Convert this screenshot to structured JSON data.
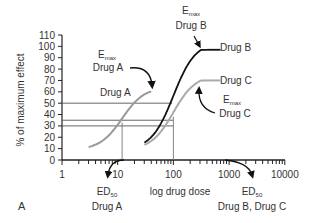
{
  "chart_data": {
    "type": "line",
    "title": "",
    "panel_label": "A",
    "xlabel": "log drug dose",
    "ylabel": "% of maximum effect",
    "x_scale": "log",
    "x_ticks": [
      "1",
      "10",
      "100",
      "1000",
      "10000"
    ],
    "y_ticks": [
      "0",
      "10",
      "20",
      "30",
      "40",
      "50",
      "60",
      "70",
      "80",
      "90",
      "100",
      "110"
    ],
    "ylim": [
      0,
      110
    ],
    "xlim": [
      1,
      10000
    ],
    "grid": false,
    "series": [
      {
        "name": "Drug A",
        "color": "#999999",
        "emax": 60,
        "ed50": 12,
        "x_range": [
          3,
          40
        ],
        "baseline": 9
      },
      {
        "name": "Drug B",
        "color": "#111111",
        "emax": 97,
        "ed50": 100,
        "x_range": [
          30,
          400
        ],
        "baseline": 9
      },
      {
        "name": "Drug C",
        "color": "#aaaaaa",
        "emax": 70,
        "ed50": 100,
        "x_range": [
          30,
          400
        ],
        "baseline": 9
      }
    ],
    "reference_lines": {
      "horizontal": [
        50,
        35,
        30
      ],
      "vertical": [
        12,
        100
      ]
    },
    "annotations": [
      {
        "text": "Emax Drug A",
        "main": "E",
        "sub": "max",
        "line2": "Drug A"
      },
      {
        "text": "Emax Drug B",
        "main": "E",
        "sub": "max",
        "line2": "Drug B"
      },
      {
        "text": "Emax Drug C",
        "main": "E",
        "sub": "max",
        "line2": "Drug C"
      },
      {
        "text": "ED50 Drug A",
        "main": "ED",
        "sub": "50",
        "line2": "Drug A"
      },
      {
        "text": "ED50 Drug B, Drug C",
        "main": "ED",
        "sub": "50",
        "line2": "Drug B, Drug C"
      }
    ],
    "curve_labels": [
      "Drug A",
      "Drug B",
      "Drug C"
    ]
  }
}
